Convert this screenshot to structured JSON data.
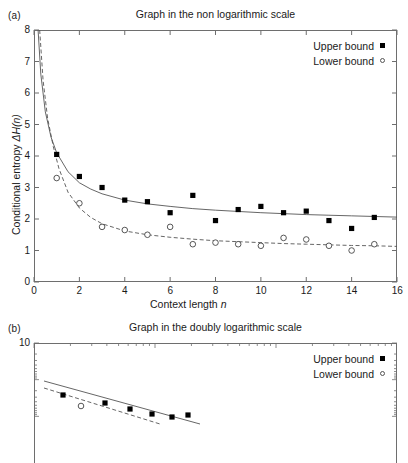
{
  "figure": {
    "panels": [
      {
        "label": "(a)",
        "title": "Graph in the non logarithmic scale",
        "xlabel_main": "Context length ",
        "xlabel_italic": "n",
        "ylabel_main": "Conditional entropy ",
        "ylabel_italic": "ΔH(n)",
        "legend": [
          {
            "text": "Upper bound",
            "marker": "filled-square"
          },
          {
            "text": "Lower bound",
            "marker": "open-circle"
          }
        ]
      },
      {
        "label": "(b)",
        "title": "Graph in the doubly logarithmic scale",
        "legend": [
          {
            "text": "Upper bound",
            "marker": "filled-square"
          },
          {
            "text": "Lower bound",
            "marker": "open-circle"
          }
        ]
      }
    ]
  },
  "chart_data": [
    {
      "type": "scatter",
      "panel": "a",
      "title": "Graph in the non logarithmic scale",
      "xlabel": "Context length n",
      "ylabel": "Conditional entropy ΔH(n)",
      "xlim": [
        0,
        16
      ],
      "ylim": [
        0,
        8
      ],
      "xticks": [
        0,
        2,
        4,
        6,
        8,
        10,
        12,
        14,
        16
      ],
      "yticks": [
        0,
        1,
        2,
        3,
        4,
        5,
        6,
        7,
        8
      ],
      "grid": false,
      "legend_position": "top-right",
      "series": [
        {
          "name": "Upper bound",
          "marker": "filled-square",
          "fit_line": "solid",
          "x": [
            1,
            2,
            3,
            4,
            5,
            6,
            7,
            8,
            9,
            10,
            11,
            12,
            13,
            14,
            15
          ],
          "y": [
            4.05,
            3.35,
            3.0,
            2.6,
            2.55,
            2.2,
            2.75,
            1.95,
            2.3,
            2.4,
            2.2,
            2.25,
            1.95,
            1.7,
            2.05
          ]
        },
        {
          "name": "Lower bound",
          "marker": "open-circle",
          "fit_line": "dashed",
          "x": [
            1,
            2,
            3,
            4,
            5,
            6,
            7,
            8,
            9,
            10,
            11,
            12,
            13,
            14,
            15
          ],
          "y": [
            3.3,
            2.5,
            1.75,
            1.65,
            1.5,
            1.75,
            1.2,
            1.25,
            1.2,
            1.15,
            1.4,
            1.35,
            1.15,
            1.0,
            1.2
          ]
        }
      ],
      "fit_curves": [
        {
          "name": "Upper bound fit",
          "style": "solid",
          "points": [
            [
              0.18,
              8.0
            ],
            [
              0.3,
              6.6
            ],
            [
              0.5,
              5.4
            ],
            [
              0.75,
              4.6
            ],
            [
              1.0,
              4.1
            ],
            [
              1.5,
              3.5
            ],
            [
              2.0,
              3.15
            ],
            [
              2.5,
              2.95
            ],
            [
              3.0,
              2.8
            ],
            [
              4.0,
              2.6
            ],
            [
              5.0,
              2.48
            ],
            [
              6.0,
              2.4
            ],
            [
              7.0,
              2.33
            ],
            [
              8.0,
              2.28
            ],
            [
              9.0,
              2.24
            ],
            [
              10.0,
              2.2
            ],
            [
              11.0,
              2.17
            ],
            [
              12.0,
              2.14
            ],
            [
              13.0,
              2.12
            ],
            [
              14.0,
              2.1
            ],
            [
              15.0,
              2.08
            ],
            [
              16.0,
              2.06
            ]
          ]
        },
        {
          "name": "Lower bound fit",
          "style": "dashed",
          "points": [
            [
              0.25,
              8.0
            ],
            [
              0.4,
              6.4
            ],
            [
              0.6,
              5.2
            ],
            [
              0.85,
              4.3
            ],
            [
              1.1,
              3.6
            ],
            [
              1.5,
              2.85
            ],
            [
              2.0,
              2.35
            ],
            [
              2.5,
              2.05
            ],
            [
              3.0,
              1.85
            ],
            [
              4.0,
              1.62
            ],
            [
              5.0,
              1.5
            ],
            [
              6.0,
              1.42
            ],
            [
              7.0,
              1.36
            ],
            [
              8.0,
              1.31
            ],
            [
              9.0,
              1.28
            ],
            [
              10.0,
              1.25
            ],
            [
              11.0,
              1.22
            ],
            [
              12.0,
              1.2
            ],
            [
              13.0,
              1.18
            ],
            [
              14.0,
              1.16
            ],
            [
              15.0,
              1.15
            ],
            [
              16.0,
              1.13
            ]
          ]
        }
      ]
    },
    {
      "type": "scatter",
      "panel": "b",
      "title": "Graph in the doubly logarithmic scale",
      "scale": "log-log",
      "ylim_top_label": "10",
      "legend_position": "top-right",
      "cropped": true,
      "series": [
        {
          "name": "Upper bound",
          "marker": "filled-square",
          "fit_line": "solid",
          "x_px": [
            63,
            105,
            130,
            152,
            172,
            188
          ],
          "y_px": [
            395,
            403,
            409,
            414,
            417,
            415
          ]
        },
        {
          "name": "Lower bound",
          "marker": "open-circle",
          "fit_line": "dashed",
          "x_px": [
            81
          ],
          "y_px": [
            406
          ]
        }
      ]
    }
  ]
}
